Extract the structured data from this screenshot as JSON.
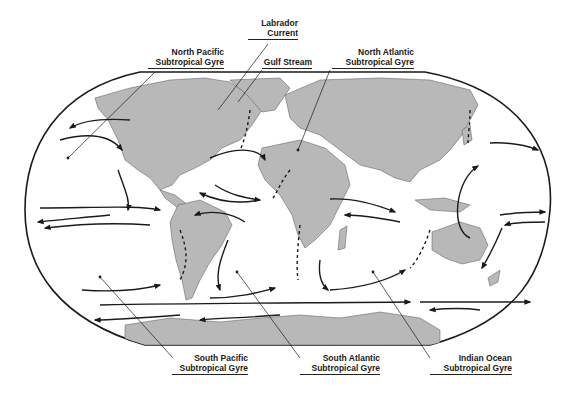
{
  "labels": {
    "labrador": {
      "line1": "Labrador",
      "line2": "Current"
    },
    "north_pacific": {
      "line1": "North Pacific",
      "line2": "Subtropical Gyre"
    },
    "gulf_stream": {
      "line1": "Gulf Stream"
    },
    "north_atlantic": {
      "line1": "North Atlantic",
      "line2": "Subtropical Gyre"
    },
    "south_pacific": {
      "line1": "South Pacific",
      "line2": "Subtropical Gyre"
    },
    "south_atlantic": {
      "line1": "South Atlantic",
      "line2": "Subtropical Gyre"
    },
    "indian_ocean": {
      "line1": "Indian Ocean",
      "line2": "Subtropical Gyre"
    }
  },
  "colors": {
    "land": "#b8b8b8",
    "ocean": "#ffffff",
    "outline": "#1a1a1a",
    "arrow": "#1a1a1a"
  }
}
